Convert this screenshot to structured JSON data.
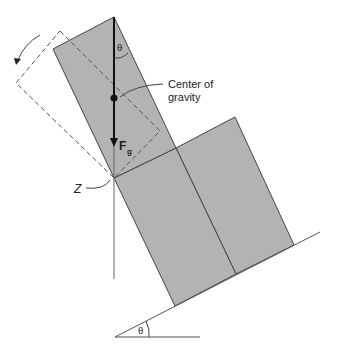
{
  "diagram": {
    "labels": {
      "center_of_gravity_line1": "Center of",
      "center_of_gravity_line2": "gravity",
      "force": "F",
      "force_subscript": "g",
      "pivot": "Z",
      "angle_top": "θ",
      "angle_bottom": "θ"
    },
    "colors": {
      "block_fill": "#b3b3b3",
      "line": "#333333",
      "dashed": "#555555"
    }
  }
}
